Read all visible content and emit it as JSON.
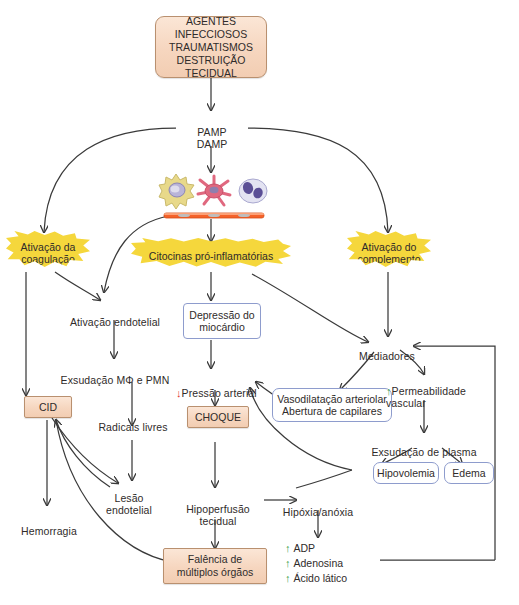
{
  "diagram": {
    "language": "pt",
    "colors": {
      "peach_fill": "#f6d6bf",
      "peach_border": "#b9906f",
      "blue_border": "#8e9ccd",
      "burst_fill": "#f5d73c",
      "arrow_stroke": "#3a3a3a",
      "increase_arrow": "#3aa14a",
      "decrease_arrow": "#e2342a",
      "membrane_bar": "#f4622a"
    },
    "nodes": {
      "trigger": "AGENTES INFECCIOSOS\nTRAUMATISMOS\nDESTRUIÇÃO TECIDUAL",
      "pamp_damp": "PAMP\nDAMP",
      "burst_coagulation": "Ativação da\ncoagulação",
      "burst_cytokines": "Citocinas pró-inflamatórias",
      "burst_complement": "Ativação do\ncomplemento",
      "endothelial_activation": "Ativação endotelial",
      "exudation_mo_pmn": "Exsudação MΦ e PMN",
      "cid": "CID",
      "free_radicals": "Radicais livres",
      "endothelial_injury": "Lesão\nendotelial",
      "hemorrhage": "Hemorragia",
      "myocardial_depression": "Depressão do\nmiocárdio",
      "arterial_pressure": "Pressão arterial",
      "shock": "CHOQUE",
      "tissue_hypoperfusion": "Hipoperfusão\ntecidual",
      "hypoxia_anoxia": "Hipóxia/anóxia",
      "multiple_organ_failure": "Falência de\nmúltiplos órgãos",
      "mediators": "Mediadores",
      "vasodilation": "Vasodilatação arteriolar\nAbertura de capilares",
      "vascular_permeability": "Permeabilidade\nvascular",
      "plasma_exudation": "Exsudação de plasma",
      "hypovolemia": "Hipovolemia",
      "edema": "Edema"
    },
    "markers": {
      "decrease": "↓",
      "increase": "↑"
    },
    "metabolites": [
      {
        "marker": "↑",
        "label": "ADP"
      },
      {
        "marker": "↑",
        "label": "Adenosina"
      },
      {
        "marker": "↑",
        "label": "Ácido lático"
      }
    ],
    "cells": [
      {
        "name": "macrophage",
        "color": "#e8d98a"
      },
      {
        "name": "dendritic-cell",
        "color": "#e0687f"
      },
      {
        "name": "neutrophil",
        "color": "#d8d9ee"
      }
    ]
  }
}
